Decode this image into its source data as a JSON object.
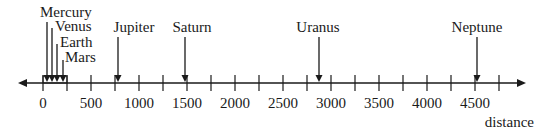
{
  "axis": {
    "label": "distance",
    "min": 0,
    "max": 4750,
    "major_step": 500,
    "minor_step": 250,
    "tick_labels": [
      "0",
      "500",
      "1000",
      "1500",
      "2000",
      "2500",
      "3000",
      "3500",
      "4000",
      "4500"
    ]
  },
  "planets": [
    {
      "name": "Mercury",
      "value": 36
    },
    {
      "name": "Venus",
      "value": 67
    },
    {
      "name": "Earth",
      "value": 93
    },
    {
      "name": "Mars",
      "value": 142
    },
    {
      "name": "Jupiter",
      "value": 780
    },
    {
      "name": "Saturn",
      "value": 1430
    },
    {
      "name": "Uranus",
      "value": 2870
    },
    {
      "name": "Neptune",
      "value": 4500
    }
  ],
  "colors": {
    "line": "#1a1a1a",
    "background": "#ffffff"
  },
  "chart_data": {
    "type": "scatter",
    "title": "",
    "xlabel": "distance",
    "ylabel": "",
    "xlim": [
      0,
      4750
    ],
    "x_ticks": [
      0,
      500,
      1000,
      1500,
      2000,
      2500,
      3000,
      3500,
      4000,
      4500
    ],
    "categories": [
      "Mercury",
      "Venus",
      "Earth",
      "Mars",
      "Jupiter",
      "Saturn",
      "Uranus",
      "Neptune"
    ],
    "values": [
      36,
      67,
      93,
      142,
      780,
      1430,
      2870,
      4500
    ],
    "grid": false,
    "legend": "none"
  }
}
